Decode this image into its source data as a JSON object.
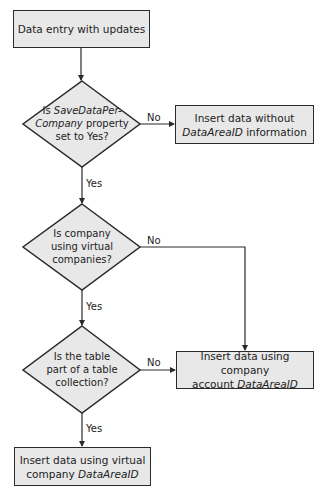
{
  "diagram": {
    "colors": {
      "fill": "#e8e8e8",
      "stroke": "#2a2a2a",
      "text": "#222222"
    },
    "start": {
      "text": "Data entry with updates"
    },
    "decision1": {
      "line1_plain": "Is ",
      "line1_italic": "SaveDataPer-",
      "line2_italic": "Company",
      "line2_plain": " property",
      "line3": "set to Yes?",
      "no_label": "No",
      "yes_label": "Yes"
    },
    "result_no_dataareaid": {
      "line1": "Insert data without",
      "line2_italic": "DataAreaID",
      "line2_plain": " information"
    },
    "decision2": {
      "line1": "Is company",
      "line2": "using virtual",
      "line3": "companies?",
      "no_label": "No",
      "yes_label": "Yes"
    },
    "decision3": {
      "line1": "Is the table",
      "line2": "part of a table",
      "line3": "collection?",
      "no_label": "No",
      "yes_label": "Yes"
    },
    "result_company_account": {
      "line1": "Insert data using company",
      "line2_plain": "account ",
      "line2_italic": "DataAreaID"
    },
    "result_virtual_company": {
      "line1": "Insert data using virtual",
      "line2_plain": "company ",
      "line2_italic": "DataAreaID"
    }
  }
}
